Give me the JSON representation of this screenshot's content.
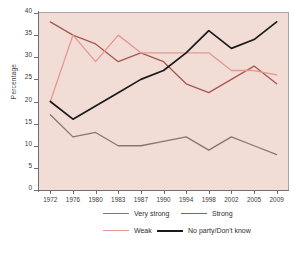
{
  "chart_data": {
    "type": "line",
    "title": "",
    "xlabel": "",
    "ylabel": "Percentage",
    "ylim": [
      0,
      40
    ],
    "ytick_step": 5,
    "grid": false,
    "legend_position": "bottom",
    "categories": [
      "1972",
      "1976",
      "1980",
      "1983",
      "1987",
      "1990",
      "1994",
      "1998",
      "2002",
      "2005",
      "2009"
    ],
    "yticks": [
      "0",
      "5",
      "10",
      "15",
      "20",
      "25",
      "30",
      "35",
      "40"
    ],
    "series": [
      {
        "name": "Very strong",
        "color": "#8a7471",
        "values": [
          17,
          12,
          13,
          10,
          10,
          11,
          12,
          9,
          12,
          10,
          8
        ]
      },
      {
        "name": "Strong",
        "color": "#a9564f",
        "values": [
          38,
          35,
          33,
          29,
          31,
          29,
          24,
          22,
          25,
          28,
          24
        ]
      },
      {
        "name": "Weak",
        "color": "#e09a92",
        "values": [
          20,
          35,
          29,
          35,
          31,
          31,
          31,
          31,
          27,
          27,
          26
        ]
      },
      {
        "name": "No party/Don't know",
        "color": "#1a1a1a",
        "values": [
          20,
          16,
          19,
          22,
          25,
          27,
          31,
          36,
          32,
          34,
          38
        ]
      }
    ]
  },
  "plot": {
    "background_color": "#f2dcd6",
    "axis_color": "#6f6f6f"
  },
  "legend": {
    "items": [
      {
        "label": "Very strong",
        "color": "#8a7471"
      },
      {
        "label": "Strong",
        "color": "#a9564f"
      },
      {
        "label": "Weak",
        "color": "#e09a92"
      },
      {
        "label": "No party/Don't know",
        "color": "#1a1a1a"
      }
    ]
  }
}
